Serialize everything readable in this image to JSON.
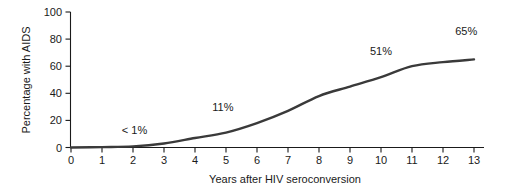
{
  "chart_data": {
    "type": "line",
    "title": "",
    "subtitle": "",
    "xlabel": "Years after HIV seroconversion",
    "ylabel": "Percentage with AIDS",
    "xlim": [
      0,
      13
    ],
    "ylim": [
      0,
      100
    ],
    "grid": false,
    "legend": "none",
    "x_ticks": [
      "0",
      "1",
      "2",
      "3",
      "4",
      "5",
      "6",
      "7",
      "8",
      "9",
      "10",
      "11",
      "12",
      "13"
    ],
    "y_ticks": [
      "0",
      "20",
      "40",
      "60",
      "80",
      "100"
    ],
    "x": [
      0,
      1,
      2,
      3,
      4,
      5,
      6,
      7,
      8,
      9,
      10,
      11,
      12,
      13
    ],
    "values": [
      0,
      0.3,
      0.8,
      3,
      7,
      11,
      18,
      27,
      38,
      45,
      52,
      60,
      63,
      65
    ],
    "series": [
      {
        "name": "Percentage with AIDS",
        "values": [
          0,
          0.3,
          0.8,
          3,
          7,
          11,
          18,
          27,
          38,
          45,
          52,
          60,
          63,
          65
        ]
      }
    ],
    "annotations": [
      {
        "label": "< 1%",
        "x": 2,
        "y": 0.8,
        "label_x": 2.05,
        "label_y": 10
      },
      {
        "label": "11%",
        "x": 5,
        "y": 11,
        "label_x": 4.9,
        "label_y": 27
      },
      {
        "label": "51%",
        "x": 10,
        "y": 52,
        "label_x": 10.0,
        "label_y": 68
      },
      {
        "label": "65%",
        "x": 13,
        "y": 65,
        "label_x": 12.75,
        "label_y": 83
      }
    ],
    "line_color": "#3a3a3a",
    "axis_color": "#1a1a1a",
    "background_color": "#ffffff"
  }
}
